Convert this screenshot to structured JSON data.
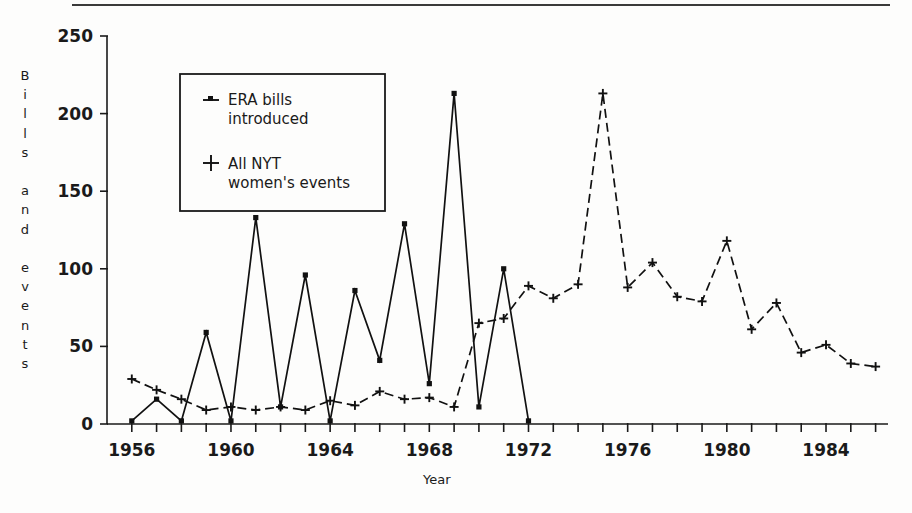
{
  "figure": {
    "y_axis_title": "Bills and events",
    "x_axis_title": "Year",
    "y_ticks": [
      "0",
      "50",
      "100",
      "150",
      "200",
      "250"
    ],
    "x_ticks": [
      "1956",
      "1960",
      "1964",
      "1968",
      "1972",
      "1976",
      "1980",
      "1984"
    ],
    "legend": {
      "entry1_line1": "ERA bills",
      "entry1_line2": "introduced",
      "entry1_marker": "square-dash-marker",
      "entry2_line1": "All NYT",
      "entry2_line2": "women's events",
      "entry2_marker": "plus-marker"
    },
    "colors": {
      "ink": "#111111",
      "background": "#fdfdfc"
    }
  },
  "chart_data": {
    "type": "line",
    "title": "",
    "xlabel": "Year",
    "ylabel": "Bills and events",
    "xlim": [
      1955,
      1986
    ],
    "ylim": [
      0,
      250
    ],
    "grid": false,
    "legend_position": "upper-left-inset",
    "x_tick_values": [
      1956,
      1960,
      1964,
      1968,
      1972,
      1976,
      1980,
      1984
    ],
    "y_tick_values": [
      0,
      50,
      100,
      150,
      200,
      250
    ],
    "series": [
      {
        "name": "ERA bills introduced",
        "marker": "square",
        "linestyle": "solid",
        "x": [
          1956,
          1957,
          1958,
          1959,
          1960,
          1961,
          1962,
          1963,
          1964,
          1965,
          1966,
          1967,
          1968,
          1969,
          1970,
          1971,
          1972
        ],
        "values": [
          2,
          16,
          2,
          59,
          2,
          133,
          11,
          96,
          2,
          86,
          41,
          129,
          26,
          213,
          11,
          100,
          2
        ]
      },
      {
        "name": "All NYT women's events",
        "marker": "plus",
        "linestyle": "dashed",
        "x": [
          1956,
          1957,
          1958,
          1959,
          1960,
          1961,
          1962,
          1963,
          1964,
          1965,
          1966,
          1967,
          1968,
          1969,
          1970,
          1971,
          1972,
          1973,
          1974,
          1975,
          1976,
          1977,
          1978,
          1979,
          1980,
          1981,
          1982,
          1983,
          1984,
          1985,
          1986
        ],
        "values": [
          29,
          22,
          16,
          9,
          11,
          9,
          11,
          9,
          15,
          12,
          21,
          16,
          17,
          11,
          65,
          68,
          89,
          81,
          90,
          213,
          88,
          104,
          82,
          79,
          118,
          61,
          78,
          46,
          51,
          39,
          37
        ]
      }
    ]
  }
}
